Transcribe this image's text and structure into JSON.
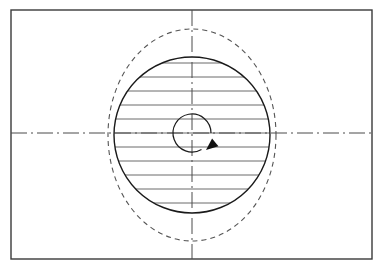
{
  "document": {
    "title": "Rotating Disc Section View",
    "type": "engineering-drawing",
    "width": 385,
    "height": 270,
    "background_color": "#ffffff"
  },
  "colors": {
    "frame": "#3a3a3a",
    "outline": "#1a1a1a",
    "hatch": "#6b6b6b",
    "centerline": "#4a4a4a",
    "phantom": "#555555",
    "arrow": "#111111"
  },
  "chart_data": {
    "type": "diagram",
    "xlabel": "",
    "ylabel": "",
    "elements": [
      {
        "name": "border-frame",
        "shape": "rectangle",
        "x": 11,
        "y": 10,
        "width": 361,
        "height": 249,
        "stroke": "#3a3a3a",
        "stroke_width": 1.4,
        "line_style": "solid",
        "fill": "none"
      },
      {
        "name": "phantom-ellipse",
        "shape": "ellipse",
        "cx": 192,
        "cy": 135,
        "rx": 84,
        "ry": 106,
        "stroke": "#555555",
        "stroke_width": 1.1,
        "line_style": "dashed",
        "dash_pattern": "5,4",
        "fill": "none"
      },
      {
        "name": "disc-outline-circle",
        "shape": "circle",
        "cx": 192,
        "cy": 135,
        "r": 78,
        "stroke": "#1a1a1a",
        "stroke_width": 1.4,
        "line_style": "solid",
        "fill": "none"
      },
      {
        "name": "hub-arc",
        "shape": "arc",
        "cx": 192,
        "cy": 133,
        "r": 19,
        "start_angle_deg": 60,
        "sweep_deg": 300,
        "stroke": "#1a1a1a",
        "stroke_width": 1.2,
        "line_style": "solid",
        "fill": "none"
      },
      {
        "name": "rotation-arrow",
        "shape": "arrowhead",
        "tip_x": 206,
        "tip_y": 150,
        "direction": "clockwise",
        "fill": "#111111"
      },
      {
        "name": "horizontal-centerline",
        "shape": "line",
        "x1": 11,
        "y1": 133,
        "x2": 372,
        "y2": 133,
        "stroke": "#4a4a4a",
        "stroke_width": 1.0,
        "line_style": "dash-dot",
        "dash_pattern": "16,4,2,4"
      },
      {
        "name": "vertical-centerline",
        "shape": "line",
        "x1": 192,
        "y1": 10,
        "x2": 192,
        "y2": 259,
        "stroke": "#4a4a4a",
        "stroke_width": 1.0,
        "line_style": "dash-dot",
        "dash_pattern": "16,4,2,4"
      }
    ],
    "section_hatching": {
      "name": "section-hatch-lines",
      "orientation": "horizontal",
      "stroke": "#6b6b6b",
      "stroke_width": 1.0,
      "line_style": "solid",
      "spacing_px": 14,
      "clip_shape": "disc-outline-circle",
      "count": 11,
      "y_positions": [
        63,
        77,
        91,
        105,
        119,
        133,
        147,
        161,
        175,
        189,
        203
      ]
    }
  }
}
